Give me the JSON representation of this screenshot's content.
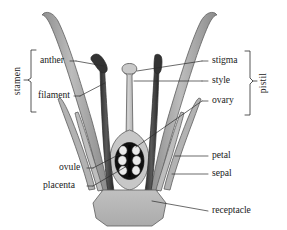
{
  "diagram": {
    "background_color": "#ffffff"
  },
  "groups": [
    {
      "id": "stamen",
      "label": "stamen",
      "side": "left",
      "orientation": "vertical",
      "members": [
        "anther",
        "filament"
      ]
    },
    {
      "id": "pistil",
      "label": "pistil",
      "side": "right",
      "orientation": "vertical",
      "members": [
        "stigma",
        "style",
        "ovary"
      ]
    }
  ],
  "labels": {
    "stamen": "stamen",
    "pistil": "pistil",
    "anther": "anther",
    "filament": "filament",
    "stigma": "stigma",
    "style": "style",
    "ovary": "ovary",
    "ovule": "ovule",
    "placenta": "placenta",
    "petal": "petal",
    "sepal": "sepal",
    "receptacle": "receptacle"
  },
  "parts": [
    {
      "id": "anther",
      "label": "anther",
      "side": "left",
      "color": "#3a3a3a"
    },
    {
      "id": "filament",
      "label": "filament",
      "side": "left",
      "color": "#3a3a3a"
    },
    {
      "id": "ovule",
      "label": "ovule",
      "side": "left",
      "color": "#e8e8e8"
    },
    {
      "id": "placenta",
      "label": "placenta",
      "side": "left",
      "color": "#111111"
    },
    {
      "id": "stigma",
      "label": "stigma",
      "side": "right",
      "color": "#b9b9b9"
    },
    {
      "id": "style",
      "label": "style",
      "side": "right",
      "color": "#c2c2c2"
    },
    {
      "id": "ovary",
      "label": "ovary",
      "side": "right",
      "color": "#121212"
    },
    {
      "id": "petal",
      "label": "petal",
      "side": "right",
      "color": "#9a9a9a"
    },
    {
      "id": "sepal",
      "label": "sepal",
      "side": "right",
      "color": "#a8a8a8"
    },
    {
      "id": "receptacle",
      "label": "receptacle",
      "side": "right",
      "color": "#b4b4b4"
    }
  ],
  "colors": {
    "petal_fill": "#a6a6a6",
    "sepal_fill": "#b0b0b0",
    "stamen_fill": "#3b3b3b",
    "style_fill": "#c4c4c4",
    "ovary_fill": "#121212",
    "ovule_fill": "#ededed",
    "receptacle_fill": "#b6b6b6",
    "outline": "#5d5d5d",
    "text": "#1a1a1a",
    "leader": "#2b2b2b"
  }
}
